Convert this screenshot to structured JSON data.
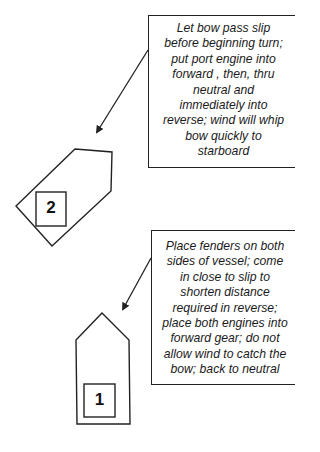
{
  "diagram": {
    "title": "",
    "notes": [
      {
        "id": "note-1",
        "points_to": "boat-2",
        "lines": [
          "Let bow pass slip",
          "before beginning turn;",
          "put port engine into",
          "forward , then, thru",
          "neutral and",
          "immediately into",
          "reverse; wind will whip",
          "bow quickly to",
          "starboard"
        ]
      },
      {
        "id": "note-2",
        "points_to": "boat-1",
        "lines": [
          "Place fenders on both",
          "sides of vessel; come",
          "in close to slip to",
          "shorten  distance",
          "required in reverse;",
          "place both engines into",
          "forward gear; do not",
          "allow wind to catch the",
          "bow; back to neutral"
        ]
      }
    ],
    "boats": [
      {
        "id": "boat-2",
        "label": "2",
        "orientation": "rotated, bow pointing up-right"
      },
      {
        "id": "boat-1",
        "label": "1",
        "orientation": "upright, bow pointing up"
      }
    ],
    "colors": {
      "stroke": "#222222",
      "background": "#ffffff"
    }
  }
}
